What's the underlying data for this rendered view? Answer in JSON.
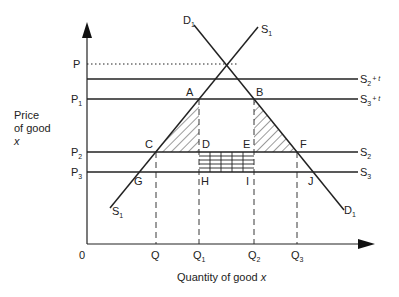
{
  "diagram": {
    "y_axis_label_lines": [
      "Price",
      "of good",
      "x"
    ],
    "x_axis_label": "Quantity of good",
    "x_axis_label_var": "x",
    "origin_label": "0",
    "price_levels": [
      {
        "id": "P",
        "label": "P",
        "sub": "",
        "y": 64,
        "style": "dotted"
      },
      {
        "id": "S2t",
        "label": "",
        "sub": "",
        "y": 79,
        "style": "solid",
        "curve_label": "S",
        "curve_sub": "2",
        "curve_sup": "+ t"
      },
      {
        "id": "P1",
        "label": "P",
        "sub": "1",
        "y": 99,
        "style": "solid",
        "curve_label": "S",
        "curve_sub": "3",
        "curve_sup": "+ t"
      },
      {
        "id": "P2",
        "label": "P",
        "sub": "2",
        "y": 152,
        "style": "solid",
        "curve_label": "S",
        "curve_sub": "2",
        "curve_sup": ""
      },
      {
        "id": "P3",
        "label": "P",
        "sub": "3",
        "y": 172,
        "style": "solid",
        "curve_label": "S",
        "curve_sub": "3",
        "curve_sup": ""
      }
    ],
    "quantity_levels": [
      {
        "label": "Q",
        "sub": "",
        "x": 156
      },
      {
        "label": "Q",
        "sub": "1",
        "x": 199
      },
      {
        "label": "Q",
        "sub": "2",
        "x": 254
      },
      {
        "label": "Q",
        "sub": "3",
        "x": 297
      }
    ],
    "curves": {
      "demand": {
        "label": "D",
        "sub": "1"
      },
      "supply": {
        "label": "S",
        "sub": "1"
      }
    },
    "points": {
      "A": "A",
      "B": "B",
      "C": "C",
      "D": "D",
      "E": "E",
      "F": "F",
      "G": "G",
      "H": "H",
      "I": "I",
      "J": "J"
    }
  }
}
